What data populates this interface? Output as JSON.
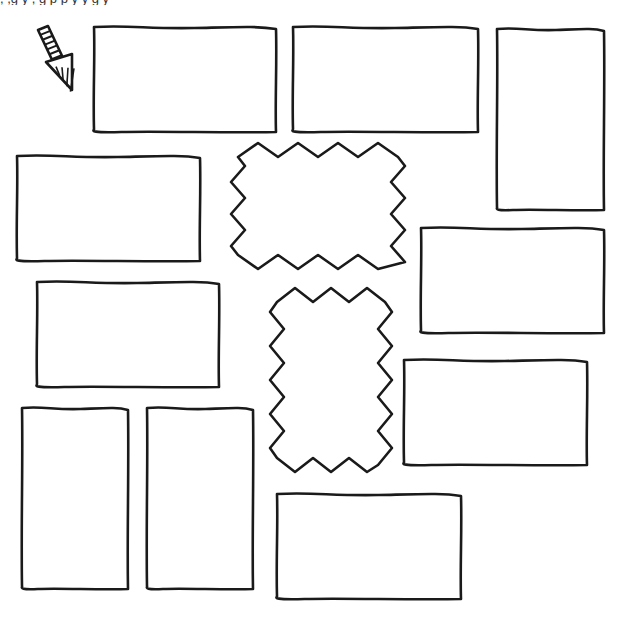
{
  "page": {
    "background": "#ffffff",
    "ink": "#1a1a1a",
    "top_text_fragment": ", ,g y  ,  g  p  p  y  y g y"
  },
  "arrow": {
    "icon": "striped-down-right-arrow-icon",
    "shaft": [
      [
        38,
        30
      ],
      [
        48,
        26
      ],
      [
        64,
        60
      ],
      [
        54,
        64
      ]
    ],
    "head": [
      [
        46,
        62
      ],
      [
        72,
        54
      ],
      [
        72,
        90
      ]
    ],
    "stripes": 7
  },
  "panels": [
    {
      "id": "panel-1",
      "shape": "rect",
      "x": 94,
      "y": 26,
      "w": 182,
      "h": 106
    },
    {
      "id": "panel-2",
      "shape": "rect",
      "x": 293,
      "y": 26,
      "w": 185,
      "h": 106
    },
    {
      "id": "panel-3",
      "shape": "rect",
      "x": 497,
      "y": 28,
      "w": 107,
      "h": 182
    },
    {
      "id": "panel-4",
      "shape": "rect",
      "x": 17,
      "y": 155,
      "w": 183,
      "h": 106
    },
    {
      "id": "panel-5",
      "shape": "rect",
      "x": 421,
      "y": 227,
      "w": 183,
      "h": 106
    },
    {
      "id": "panel-6",
      "shape": "rect",
      "x": 37,
      "y": 281,
      "w": 182,
      "h": 106
    },
    {
      "id": "panel-7",
      "shape": "rect",
      "x": 404,
      "y": 359,
      "w": 183,
      "h": 106
    },
    {
      "id": "panel-8",
      "shape": "rect",
      "x": 22,
      "y": 407,
      "w": 106,
      "h": 182
    },
    {
      "id": "panel-9",
      "shape": "rect",
      "x": 147,
      "y": 407,
      "w": 106,
      "h": 182
    },
    {
      "id": "panel-10",
      "shape": "rect",
      "x": 277,
      "y": 493,
      "w": 184,
      "h": 106
    }
  ],
  "bursts": [
    {
      "id": "burst-1",
      "shape": "starburst",
      "x": 238,
      "y": 150,
      "w": 160,
      "h": 112,
      "teeth_x": 8,
      "teeth_y": 7,
      "depth": 14
    },
    {
      "id": "burst-2",
      "shape": "starburst",
      "x": 277,
      "y": 295,
      "w": 108,
      "h": 170,
      "teeth_x": 6,
      "teeth_y": 10,
      "depth": 14
    }
  ]
}
